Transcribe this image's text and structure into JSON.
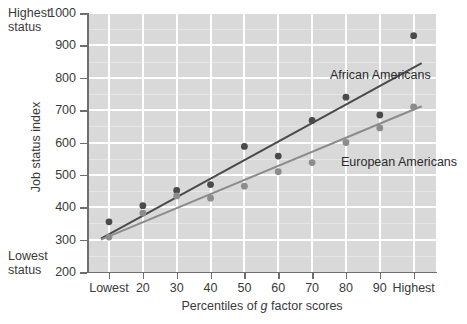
{
  "chart_data": {
    "type": "scatter",
    "title": "",
    "xlabel": "Percentiles of g factor scores",
    "xlabel_plain": "Percentiles of ",
    "xlabel_italic": "g",
    "xlabel_tail": " factor scores",
    "ylabel": "Job status index",
    "xlim": [
      0,
      10
    ],
    "ylim": [
      200,
      1000
    ],
    "grid": true,
    "legend_position": "inline-annotation",
    "categories": [
      "Lowest",
      "20",
      "30",
      "40",
      "50",
      "60",
      "70",
      "80",
      "90",
      "Highest"
    ],
    "x_tick_labels": [
      "Lowest",
      "20",
      "30",
      "40",
      "50",
      "60",
      "70",
      "80",
      "90",
      "Highest"
    ],
    "y_tick_labels": [
      "200",
      "300",
      "400",
      "500",
      "600",
      "700",
      "800",
      "900",
      "1000"
    ],
    "y_ticks": [
      200,
      300,
      400,
      500,
      600,
      700,
      800,
      900,
      1000
    ],
    "annotations": {
      "top_left": "Highest\nstatus",
      "bottom_left": "Lowest\nstatus"
    },
    "series": [
      {
        "name": "African Americans",
        "color": "#4a4a4a",
        "marker_color": "#4a4a4a",
        "values": [
          355,
          405,
          452,
          470,
          588,
          558,
          668,
          740,
          685,
          930
        ],
        "fit_line": {
          "y_start": 303,
          "y_end": 845
        }
      },
      {
        "name": "European Americans",
        "color": "#8c8c8c",
        "marker_color": "#8c8c8c",
        "values": [
          308,
          382,
          435,
          428,
          465,
          510,
          538,
          600,
          645,
          710
        ],
        "fit_line": {
          "y_start": 300,
          "y_end": 712
        }
      }
    ]
  }
}
